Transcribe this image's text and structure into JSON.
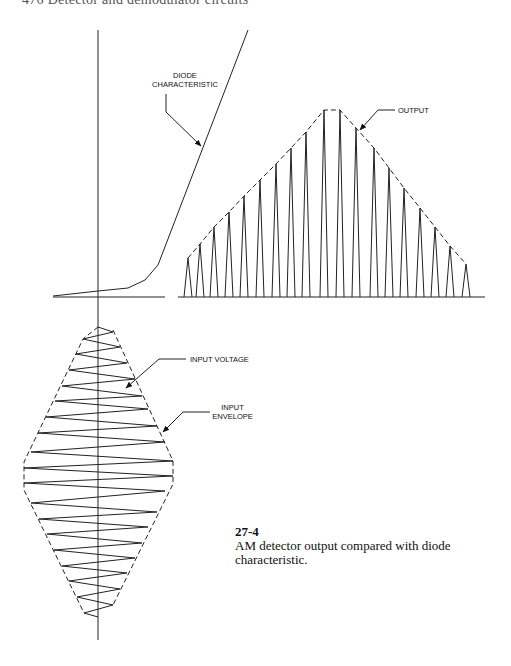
{
  "page": {
    "running_header": "476 Detector and demodulator circuits"
  },
  "labels": {
    "diode_characteristic": [
      "DIODE",
      "CHARACTERISTIC"
    ],
    "output": "OUTPUT",
    "input_voltage": "INPUT VOLTAGE",
    "input_envelope": [
      "INPUT",
      "ENVELOPE"
    ]
  },
  "caption": {
    "number": "27-4",
    "text": "AM detector output compared with diode characteristic."
  },
  "diagram": {
    "diode_curve": [
      [
        53,
        296
      ],
      [
        98,
        291
      ],
      [
        128,
        288
      ],
      [
        145,
        280
      ],
      [
        158,
        265
      ],
      [
        248,
        30
      ]
    ],
    "output_pulse_peaks_x": [
      188,
      200,
      214,
      229,
      244,
      260,
      276,
      291,
      306,
      324,
      340,
      356,
      374,
      389,
      404,
      420,
      435,
      450,
      466
    ],
    "output_pulse_peaks_y": [
      258,
      244,
      227,
      212,
      196,
      180,
      164,
      148,
      132,
      110,
      110,
      128,
      148,
      168,
      188,
      208,
      227,
      246,
      264
    ],
    "input_zigzag": [
      [
        98,
        327
      ],
      [
        113,
        332
      ],
      [
        83,
        339
      ],
      [
        120,
        347
      ],
      [
        76,
        354
      ],
      [
        127,
        363
      ],
      [
        69,
        370
      ],
      [
        135,
        379
      ],
      [
        62,
        386
      ],
      [
        142,
        396
      ],
      [
        55,
        401
      ],
      [
        148,
        409
      ],
      [
        46,
        417
      ],
      [
        157,
        426
      ],
      [
        38,
        433
      ],
      [
        165,
        442
      ],
      [
        31,
        452
      ],
      [
        173,
        461
      ],
      [
        24,
        468
      ],
      [
        173,
        476
      ],
      [
        24,
        483
      ],
      [
        165,
        491
      ],
      [
        31,
        503
      ],
      [
        157,
        512
      ],
      [
        39,
        519
      ],
      [
        148,
        527
      ],
      [
        47,
        534
      ],
      [
        142,
        543
      ],
      [
        54,
        550
      ],
      [
        135,
        558
      ],
      [
        62,
        566
      ],
      [
        127,
        573
      ],
      [
        69,
        581
      ],
      [
        120,
        589
      ],
      [
        77,
        597
      ],
      [
        113,
        605
      ],
      [
        84,
        613
      ],
      [
        98,
        617
      ]
    ]
  }
}
